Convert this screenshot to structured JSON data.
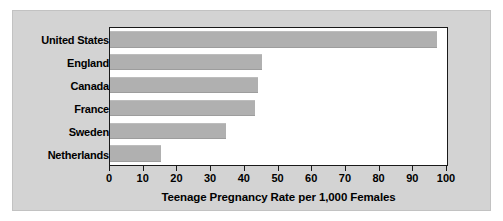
{
  "chart_data": {
    "type": "bar",
    "orientation": "horizontal",
    "title": "",
    "xlabel": "Teenage Pregnancy Rate per 1,000 Females",
    "ylabel": "",
    "categories": [
      "United States",
      "England",
      "Canada",
      "France",
      "Sweden",
      "Netherlands"
    ],
    "values": [
      97,
      45,
      44,
      43,
      34.5,
      15
    ],
    "series": [
      {
        "name": "Teenage Pregnancy Rate",
        "values": [
          97,
          45,
          44,
          43,
          34.5,
          15
        ]
      }
    ],
    "xlim": [
      0,
      100
    ],
    "xticks": [
      0,
      10,
      20,
      30,
      40,
      50,
      60,
      70,
      80,
      90,
      100
    ],
    "xtick_labels": [
      "0",
      "10",
      "20",
      "30",
      "40",
      "50",
      "60",
      "70",
      "80",
      "90",
      "100"
    ],
    "grid": false,
    "legend": false,
    "legend_position": "none",
    "colors": {
      "bar_fill": "#b0b0b0",
      "plot_background": "#ffffff",
      "panel_background": "#d3d3d3",
      "frame": "#1a1a1a",
      "text": "#000000",
      "page_background": "#ffffff"
    }
  }
}
